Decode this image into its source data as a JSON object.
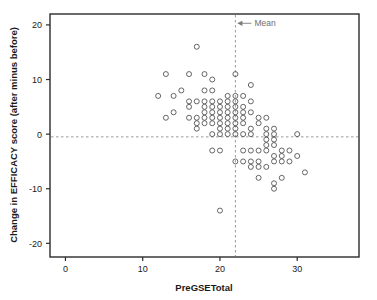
{
  "chart_data": {
    "type": "scatter",
    "title": "",
    "xlabel": "PreGSETotal",
    "ylabel": "Change in EFFICACY score (after minus before)",
    "xlim": [
      -2.0,
      38.0
    ],
    "ylim": [
      -22.5,
      22.0
    ],
    "xticks": [
      0,
      10,
      20,
      30
    ],
    "yticks": [
      20,
      10,
      0,
      -10,
      -20
    ],
    "xtick_labels": [
      "0",
      "10",
      "20",
      "30"
    ],
    "ytick_labels": [
      "20",
      "10",
      "0",
      "-10",
      "-20"
    ],
    "grid": false,
    "legend": null,
    "marker": "open-circle",
    "marker_color": "#555555",
    "annotations": [
      {
        "name": "mean-line-label",
        "text": "Mean",
        "x": 22,
        "y": 20.3,
        "arrow": "left",
        "color": "#7a7a7a"
      }
    ],
    "reference_lines": [
      {
        "name": "mean-vertical-line",
        "orientation": "vertical",
        "value": 22,
        "style": "dashed",
        "color": "#9a9a9a"
      },
      {
        "name": "zero-horizontal-line",
        "orientation": "horizontal",
        "value": -0.5,
        "style": "dashed",
        "color": "#9a9a9a"
      }
    ],
    "points": [
      [
        12,
        7
      ],
      [
        13,
        11
      ],
      [
        13,
        3
      ],
      [
        14,
        7
      ],
      [
        14,
        4
      ],
      [
        15,
        8
      ],
      [
        16,
        11
      ],
      [
        16,
        6
      ],
      [
        16,
        5
      ],
      [
        16,
        3
      ],
      [
        17,
        16
      ],
      [
        17,
        6
      ],
      [
        17,
        2
      ],
      [
        17,
        1
      ],
      [
        17,
        3
      ],
      [
        18,
        11
      ],
      [
        18,
        8
      ],
      [
        18,
        6
      ],
      [
        18,
        5
      ],
      [
        18,
        4
      ],
      [
        18,
        3
      ],
      [
        18,
        2
      ],
      [
        19,
        10
      ],
      [
        19,
        8
      ],
      [
        19,
        6
      ],
      [
        19,
        5
      ],
      [
        19,
        4
      ],
      [
        19,
        3
      ],
      [
        19,
        2
      ],
      [
        19,
        0
      ],
      [
        19,
        -3
      ],
      [
        20,
        6
      ],
      [
        20,
        5
      ],
      [
        20,
        4
      ],
      [
        20,
        3
      ],
      [
        20,
        2
      ],
      [
        20,
        1
      ],
      [
        20,
        0
      ],
      [
        20,
        -3
      ],
      [
        20,
        -14
      ],
      [
        21,
        7
      ],
      [
        21,
        6
      ],
      [
        21,
        5
      ],
      [
        21,
        4
      ],
      [
        21,
        3
      ],
      [
        21,
        2
      ],
      [
        21,
        1
      ],
      [
        21,
        0
      ],
      [
        22,
        11
      ],
      [
        22,
        7
      ],
      [
        22,
        6
      ],
      [
        22,
        5
      ],
      [
        22,
        4
      ],
      [
        22,
        3
      ],
      [
        22,
        2
      ],
      [
        22,
        1
      ],
      [
        22,
        0
      ],
      [
        22,
        -5
      ],
      [
        23,
        7
      ],
      [
        23,
        5
      ],
      [
        23,
        4
      ],
      [
        23,
        3
      ],
      [
        23,
        2
      ],
      [
        23,
        0
      ],
      [
        23,
        -3
      ],
      [
        23,
        -5
      ],
      [
        24,
        9
      ],
      [
        24,
        6
      ],
      [
        24,
        4
      ],
      [
        24,
        1
      ],
      [
        24,
        0
      ],
      [
        24,
        -3
      ],
      [
        24,
        -5
      ],
      [
        24,
        -6
      ],
      [
        25,
        3
      ],
      [
        25,
        2
      ],
      [
        25,
        -3
      ],
      [
        25,
        -5
      ],
      [
        25,
        -6
      ],
      [
        25,
        -8
      ],
      [
        26,
        3
      ],
      [
        26,
        1
      ],
      [
        26,
        0
      ],
      [
        26,
        -1
      ],
      [
        26,
        -2
      ],
      [
        26,
        -3
      ],
      [
        26,
        -6
      ],
      [
        27,
        1
      ],
      [
        27,
        0
      ],
      [
        27,
        -1
      ],
      [
        27,
        -2
      ],
      [
        27,
        -4
      ],
      [
        27,
        -5
      ],
      [
        27,
        -9
      ],
      [
        27,
        -10
      ],
      [
        28,
        -3
      ],
      [
        28,
        -4
      ],
      [
        28,
        -5
      ],
      [
        28,
        -8
      ],
      [
        29,
        -3
      ],
      [
        29,
        -5
      ],
      [
        30,
        0
      ],
      [
        30,
        -4
      ],
      [
        31,
        -7
      ]
    ]
  },
  "axis": {
    "x_title": "PreGSETotal",
    "y_title": "Change in EFFICACY score (after minus before)"
  }
}
